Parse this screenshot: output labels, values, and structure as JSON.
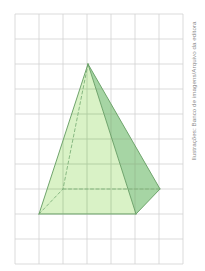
{
  "figure": {
    "caption": "Ilustrações: Banco de imagens/Arquivo da editora",
    "grid": {
      "x0": 15,
      "y0": 14,
      "cols": 7,
      "rows": 10,
      "cell_w": 24,
      "cell_h": 25,
      "line_color": "#d2d2d2"
    },
    "vertices": {
      "apex": [
        88,
        64
      ],
      "base_front_left": [
        39,
        214
      ],
      "base_front_right": [
        136,
        214
      ],
      "base_back_right": [
        160,
        189
      ],
      "base_back_left_hidden": [
        63,
        189
      ]
    },
    "colors": {
      "front_face": "#d9f2c6",
      "right_face": "#a6d6a4",
      "edge": "#6fa46c",
      "hidden_edge": "#7fb27a",
      "grid_under_face": "#8fae85"
    }
  }
}
